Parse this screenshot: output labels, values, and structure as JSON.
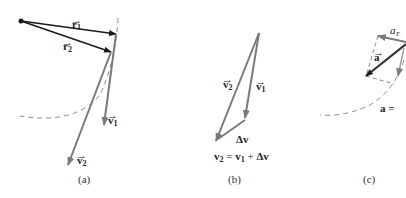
{
  "panels": {
    "a": {
      "caption": "(a)",
      "labels": {
        "r1": "r",
        "r1_sub": "1",
        "r2": "r",
        "r2_sub": "2",
        "v1": "v",
        "v1_sub": "1",
        "v2": "v",
        "v2_sub": "2"
      }
    },
    "b": {
      "caption": "(b)",
      "labels": {
        "v2": "v",
        "v2_sub": "2",
        "v1": "v",
        "v1_sub": "1",
        "dv": "Δv"
      },
      "equation": {
        "lhs": "v",
        "lhs_sub": "2",
        "eq": " = ",
        "t1": "v",
        "t1_sub": "1",
        "plus": " + ",
        "t2": "Δv"
      }
    },
    "c": {
      "caption": "(c)",
      "labels": {
        "a": "a",
        "aT": "a",
        "aT_sub": "T",
        "a_eq": "a ="
      }
    }
  },
  "colors": {
    "black_vector": "#1a1a1a",
    "gray_vector": "#7a7a7a",
    "dashed": "#8a8a8a"
  }
}
